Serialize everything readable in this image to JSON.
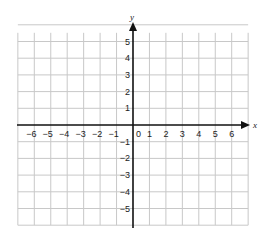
{
  "chart_data": {
    "type": "coordinate-grid",
    "title": "",
    "xlabel": "x",
    "ylabel": "y",
    "xlim": [
      -7,
      7
    ],
    "ylim": [
      -6,
      6
    ],
    "grid": true,
    "x_ticks": [
      "-6",
      "-5",
      "-4",
      "-3",
      "-2",
      "-1",
      "0",
      "1",
      "2",
      "3",
      "4",
      "5",
      "6"
    ],
    "y_ticks": [
      "5",
      "4",
      "3",
      "2",
      "1",
      "-1",
      "-2",
      "-3",
      "-4",
      "-5"
    ],
    "points": []
  },
  "labels": {
    "x_axis": "x",
    "y_axis": "y",
    "origin": "0"
  },
  "colors": {
    "grid": "#c8c8c8",
    "axis": "#111111",
    "text": "#222222"
  }
}
